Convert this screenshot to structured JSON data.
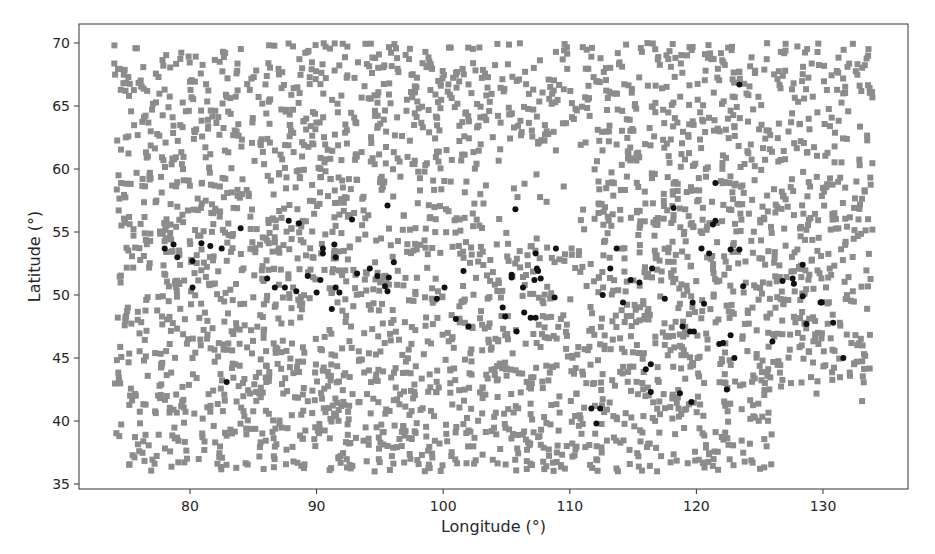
{
  "chart_data": {
    "type": "scatter",
    "title": "",
    "xlabel": "Longitude (°)",
    "ylabel": "Latitude (°)",
    "xlim": [
      72.2,
      136.2
    ],
    "ylim": [
      34.2,
      71.5
    ],
    "xticks": [
      80,
      90,
      100,
      110,
      120,
      130
    ],
    "yticks": [
      35,
      40,
      45,
      50,
      55,
      60,
      65,
      70
    ],
    "grid": false,
    "legend": null,
    "series": [
      {
        "name": "background grid points",
        "marker": "square",
        "color": "#8c8c8c",
        "size": 6,
        "generated": {
          "count": 3000,
          "seed": 12345,
          "lon_range": [
            74,
            134
          ],
          "lat_range": [
            36,
            70
          ],
          "sparse_zones": [
            {
              "lon": [
                103,
                112
              ],
              "lat": [
                54.5,
                62
              ],
              "keep": 0.15
            },
            {
              "lon": [
                126,
                134
              ],
              "lat": [
                36,
                43
              ],
              "keep": 0.05
            },
            {
              "lon": [
                129,
                134
              ],
              "lat": [
                36,
                38.5
              ],
              "keep": 0.0
            }
          ]
        }
      },
      {
        "name": "highlighted stations",
        "marker": "circle",
        "color": "#111111",
        "size": 6,
        "points": [
          [
            78.0,
            53.7
          ],
          [
            78.7,
            54.0
          ],
          [
            79.0,
            53.0
          ],
          [
            80.2,
            52.7
          ],
          [
            80.2,
            50.6
          ],
          [
            80.9,
            54.1
          ],
          [
            81.6,
            53.9
          ],
          [
            82.5,
            53.7
          ],
          [
            84.0,
            55.3
          ],
          [
            87.8,
            55.9
          ],
          [
            88.6,
            55.7
          ],
          [
            86.1,
            51.3
          ],
          [
            86.7,
            50.6
          ],
          [
            87.5,
            50.6
          ],
          [
            88.4,
            50.3
          ],
          [
            89.3,
            51.5
          ],
          [
            90.0,
            50.2
          ],
          [
            90.3,
            51.2
          ],
          [
            90.5,
            53.7
          ],
          [
            90.5,
            53.3
          ],
          [
            91.4,
            54.0
          ],
          [
            91.5,
            53.0
          ],
          [
            91.5,
            50.6
          ],
          [
            91.8,
            50.2
          ],
          [
            91.2,
            48.9
          ],
          [
            92.8,
            56.0
          ],
          [
            93.2,
            51.7
          ],
          [
            94.2,
            52.1
          ],
          [
            94.8,
            51.5
          ],
          [
            95.7,
            51.4
          ],
          [
            95.4,
            50.7
          ],
          [
            95.6,
            50.3
          ],
          [
            96.1,
            52.6
          ],
          [
            95.6,
            57.1
          ],
          [
            105.7,
            56.8
          ],
          [
            108.9,
            53.7
          ],
          [
            107.3,
            53.3
          ],
          [
            107.4,
            52.1
          ],
          [
            107.5,
            51.9
          ],
          [
            107.2,
            51.2
          ],
          [
            107.7,
            51.3
          ],
          [
            105.4,
            51.6
          ],
          [
            105.4,
            51.4
          ],
          [
            106.3,
            50.6
          ],
          [
            101.6,
            51.9
          ],
          [
            100.1,
            50.6
          ],
          [
            99.5,
            49.7
          ],
          [
            108.8,
            49.8
          ],
          [
            104.7,
            49.0
          ],
          [
            104.9,
            48.3
          ],
          [
            106.4,
            48.6
          ],
          [
            106.9,
            48.2
          ],
          [
            107.3,
            48.2
          ],
          [
            101.0,
            48.1
          ],
          [
            102.0,
            47.5
          ],
          [
            105.8,
            47.1
          ],
          [
            121.5,
            58.9
          ],
          [
            118.2,
            56.9
          ],
          [
            121.5,
            55.9
          ],
          [
            121.3,
            55.6
          ],
          [
            113.7,
            53.7
          ],
          [
            120.4,
            53.7
          ],
          [
            121.0,
            53.3
          ],
          [
            122.7,
            53.6
          ],
          [
            123.4,
            53.6
          ],
          [
            113.2,
            52.1
          ],
          [
            116.5,
            52.1
          ],
          [
            114.8,
            51.2
          ],
          [
            115.5,
            51.0
          ],
          [
            123.7,
            50.7
          ],
          [
            112.6,
            50.0
          ],
          [
            114.2,
            49.4
          ],
          [
            117.5,
            49.7
          ],
          [
            119.7,
            49.4
          ],
          [
            120.6,
            49.3
          ],
          [
            118.9,
            47.5
          ],
          [
            119.5,
            47.1
          ],
          [
            119.8,
            47.1
          ],
          [
            122.7,
            46.8
          ],
          [
            121.8,
            46.1
          ],
          [
            122.1,
            46.2
          ],
          [
            123.0,
            45.0
          ],
          [
            126.0,
            46.3
          ],
          [
            128.7,
            47.7
          ],
          [
            130.8,
            47.8
          ],
          [
            129.8,
            49.4
          ],
          [
            131.6,
            45.0
          ],
          [
            116.4,
            44.5
          ],
          [
            116.0,
            44.1
          ],
          [
            116.4,
            42.3
          ],
          [
            118.7,
            42.2
          ],
          [
            119.6,
            41.5
          ],
          [
            122.4,
            42.5
          ],
          [
            111.7,
            41.0
          ],
          [
            112.4,
            41.0
          ],
          [
            112.1,
            39.8
          ],
          [
            128.4,
            52.4
          ],
          [
            126.8,
            51.1
          ],
          [
            127.6,
            51.3
          ],
          [
            127.7,
            50.9
          ],
          [
            128.4,
            49.9
          ],
          [
            129.9,
            49.4
          ],
          [
            82.9,
            43.1
          ],
          [
            123.4,
            66.7
          ]
        ]
      }
    ]
  },
  "layout": {
    "plot_area": {
      "left": 79,
      "top": 24,
      "right": 908,
      "bottom": 489
    }
  }
}
